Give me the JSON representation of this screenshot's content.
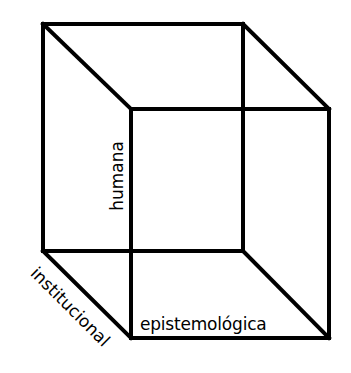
{
  "diagram": {
    "type": "wireframe-cube",
    "stroke_color": "#000000",
    "background_color": "#ffffff",
    "stroke_width": 4,
    "vertices": {
      "back_top_left": [
        43,
        24
      ],
      "back_top_right": [
        243,
        24
      ],
      "back_bottom_left": [
        43,
        251
      ],
      "back_bottom_right": [
        243,
        251
      ],
      "front_top_left": [
        131,
        109
      ],
      "front_top_right": [
        329,
        109
      ],
      "front_bottom_left": [
        131,
        338
      ],
      "front_bottom_right": [
        329,
        338
      ]
    },
    "labels": {
      "vertical_axis": "humana",
      "depth_axis": "institucional",
      "horizontal_axis": "epistemológica"
    }
  }
}
